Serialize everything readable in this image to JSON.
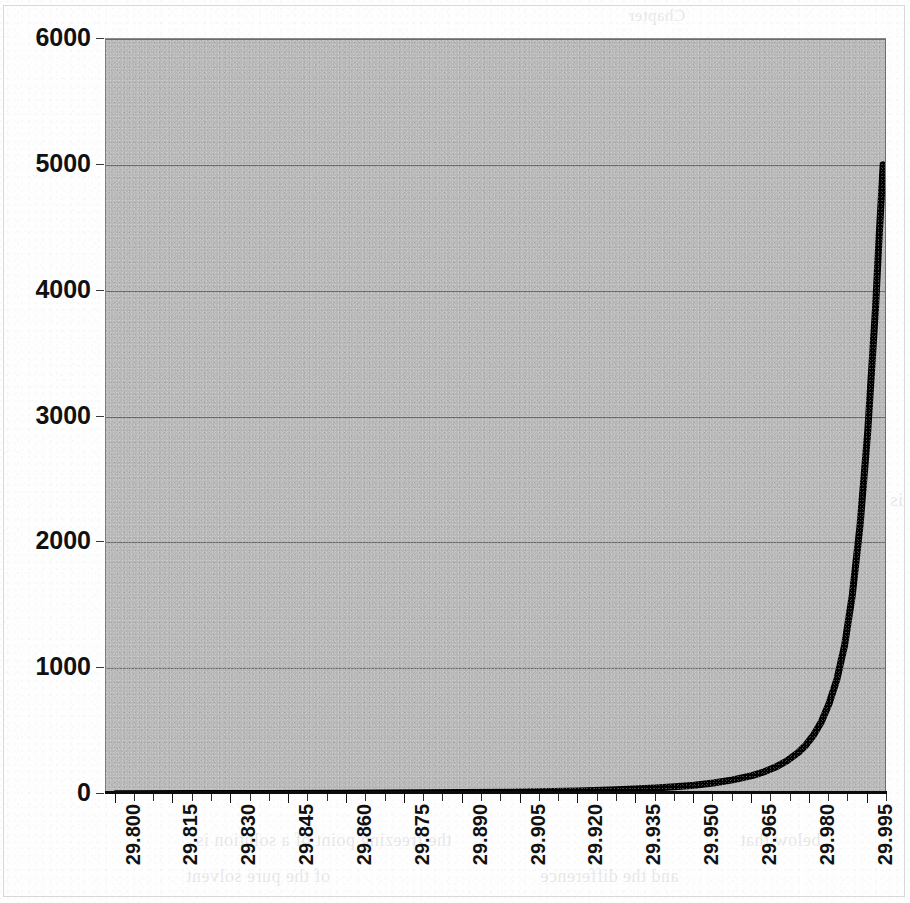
{
  "chart_data": {
    "type": "line",
    "title": "",
    "subtitle": "",
    "xlabel": "",
    "ylabel": "",
    "grid": true,
    "legend": false,
    "plot_background_color": "#b9b9b9",
    "series_color": "#000000",
    "series_line_width": 7,
    "xlim": [
      29.7975,
      30.0
    ],
    "ylim": [
      0,
      6000
    ],
    "y_ticks": [
      0,
      1000,
      2000,
      3000,
      4000,
      5000,
      6000
    ],
    "y_tick_labels": [
      "0",
      "1000",
      "2000",
      "3000",
      "4000",
      "5000",
      "6000"
    ],
    "x_tick_labels": [
      "29.800",
      "29.815",
      "29.830",
      "29.845",
      "29.860",
      "29.875",
      "29.890",
      "29.905",
      "29.920",
      "29.935",
      "29.950",
      "29.965",
      "29.980",
      "29.995"
    ],
    "x_tick_values": [
      29.8,
      29.815,
      29.83,
      29.845,
      29.86,
      29.875,
      29.89,
      29.905,
      29.92,
      29.935,
      29.95,
      29.965,
      29.98,
      29.995
    ],
    "x_minor_tick_step": 0.005,
    "series": [
      {
        "name": "curve",
        "x": [
          29.8,
          29.82,
          29.84,
          29.86,
          29.88,
          29.9,
          29.91,
          29.92,
          29.93,
          29.94,
          29.945,
          29.95,
          29.955,
          29.96,
          29.965,
          29.968,
          29.971,
          29.974,
          29.977,
          29.979,
          29.981,
          29.983,
          29.985,
          29.987,
          29.989,
          29.991,
          29.993,
          29.995,
          29.997,
          29.998,
          29.999
        ],
        "y": [
          2,
          3,
          4,
          6,
          9,
          14,
          18,
          24,
          33,
          47,
          57,
          70,
          88,
          112,
          146,
          175,
          212,
          262,
          330,
          390,
          470,
          575,
          720,
          910,
          1180,
          1580,
          2130,
          2880,
          3850,
          4450,
          5000
        ]
      }
    ],
    "annotations": []
  },
  "scan": {
    "bleed_text_lines": [
      {
        "text": "Chapter",
        "x": 628,
        "y": 6,
        "size": 17
      },
      {
        "text": "3. Freezing",
        "x": 372,
        "y": 72,
        "size": 22
      },
      {
        "text": "Point Depression",
        "x": 486,
        "y": 72,
        "size": 22
      },
      {
        "text": "the pressure and temperature",
        "x": 388,
        "y": 110,
        "size": 18
      },
      {
        "text": "to obtain",
        "x": 712,
        "y": 110,
        "size": 18
      },
      {
        "text": "the vapor pressure of a solvent",
        "x": 378,
        "y": 148,
        "size": 18
      },
      {
        "text": "above",
        "x": 760,
        "y": 148,
        "size": 18
      },
      {
        "text": "a solution",
        "x": 398,
        "y": 186,
        "size": 18
      },
      {
        "text": "is lower than that of the pure",
        "x": 430,
        "y": 224,
        "size": 18
      },
      {
        "text": "solvent",
        "x": 800,
        "y": 224,
        "size": 18
      },
      {
        "text": "at the same temperature",
        "x": 412,
        "y": 262,
        "size": 18
      },
      {
        "text": "and",
        "x": 790,
        "y": 262,
        "size": 18
      },
      {
        "text": "the solution must be",
        "x": 396,
        "y": 300,
        "size": 18
      },
      {
        "text": "cooled to",
        "x": 740,
        "y": 300,
        "size": 18
      },
      {
        "text": "a lower temperature",
        "x": 404,
        "y": 338,
        "size": 18
      },
      {
        "text": "before",
        "x": 760,
        "y": 338,
        "size": 18
      },
      {
        "text": "the solid phase appears",
        "x": 386,
        "y": 376,
        "size": 18
      },
      {
        "text": "for the",
        "x": 770,
        "y": 376,
        "size": 18
      },
      {
        "text": "solvent in equilibrium",
        "x": 394,
        "y": 414,
        "size": 18
      },
      {
        "text": "with the",
        "x": 748,
        "y": 414,
        "size": 18
      },
      {
        "text": "molality of solute in the solution and spec",
        "x": 138,
        "y": 452,
        "size": 18
      },
      {
        "text": "the cryoscopic constant",
        "x": 156,
        "y": 490,
        "size": 18
      },
      {
        "text": "of the solvent and",
        "x": 560,
        "y": 490,
        "size": 18
      },
      {
        "text": "is",
        "x": 890,
        "y": 490,
        "size": 18
      },
      {
        "text": "the equation above is",
        "x": 160,
        "y": 562,
        "size": 18
      },
      {
        "text": "only",
        "x": 560,
        "y": 562,
        "size": 18
      },
      {
        "text": "a limiting law and is",
        "x": 392,
        "y": 600,
        "size": 18
      },
      {
        "text": "most accurate",
        "x": 700,
        "y": 600,
        "size": 18
      },
      {
        "text": "valid for dilute",
        "x": 408,
        "y": 638,
        "size": 18
      },
      {
        "text": "solutions",
        "x": 700,
        "y": 638,
        "size": 18
      },
      {
        "text": "where the molality",
        "x": 414,
        "y": 676,
        "size": 18
      },
      {
        "text": "is small",
        "x": 752,
        "y": 676,
        "size": 18
      },
      {
        "text": "the freezing point of a solution is",
        "x": 196,
        "y": 830,
        "size": 18
      },
      {
        "text": "below that",
        "x": 740,
        "y": 830,
        "size": 18
      },
      {
        "text": "of the pure solvent",
        "x": 186,
        "y": 866,
        "size": 18
      },
      {
        "text": "and the difference",
        "x": 540,
        "y": 866,
        "size": 18
      }
    ]
  }
}
